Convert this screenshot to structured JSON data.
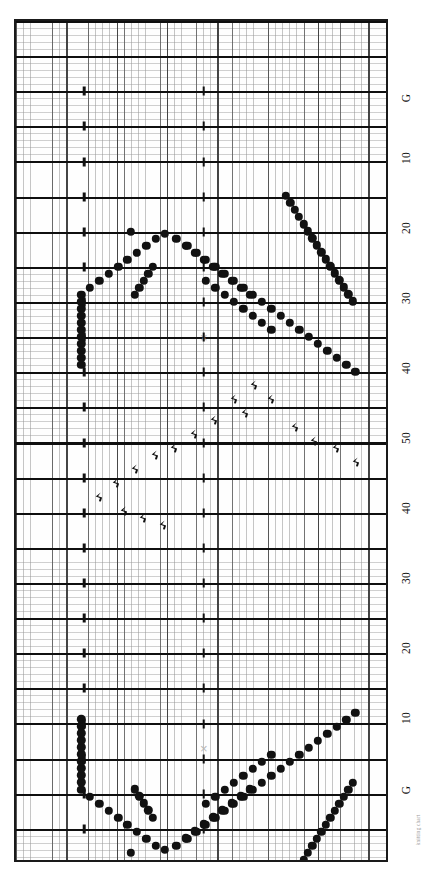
{
  "chart_data": {
    "type": "table",
    "orientation": "rotated-90",
    "grid": {
      "columns": 52,
      "rows": 120,
      "fine_grid": true,
      "bold_every_rows": 5,
      "bold_every_cols": 7,
      "cell_width_px": 7.192,
      "cell_height_px": 7.025
    },
    "legend": {
      "dot": "yarn-over / purl dot",
      "cross": "no-stitch",
      "tick": "decrease"
    },
    "row_labels": [
      "G",
      "10",
      "20",
      "30",
      "40",
      "50",
      "40",
      "30",
      "20",
      "10",
      "G"
    ],
    "row_label_positions_px": [
      98,
      158,
      228,
      298,
      368,
      438,
      508,
      578,
      648,
      718,
      790
    ],
    "footnote": "knitting chart",
    "colors": {
      "symbol": "#111111",
      "cross": "#b8b8b8",
      "grid_fine": "#969696",
      "grid_bold": "#0f0f0f",
      "border": "#1a1a1a",
      "background": "#fefefe"
    },
    "dots": [
      [
        36.0,
        194.0
      ],
      [
        37.0,
        201.5
      ],
      [
        38.0,
        208.5
      ],
      [
        39.0,
        215.5
      ],
      [
        40.0,
        222.5
      ],
      [
        41.0,
        229.5
      ],
      [
        42.0,
        236.5
      ],
      [
        43.0,
        243.5
      ],
      [
        44.0,
        250.5
      ],
      [
        45.0,
        257.5
      ],
      [
        46.0,
        264.5
      ],
      [
        47.0,
        271.5
      ],
      [
        48.0,
        278.5
      ],
      [
        49.0,
        285.5
      ],
      [
        50.0,
        292.5
      ],
      [
        17.0,
        229.5
      ],
      [
        18.0,
        236.5
      ],
      [
        19.0,
        243.5
      ],
      [
        20.0,
        250.5
      ],
      [
        21.0,
        257.5
      ],
      [
        16.0,
        236.5
      ],
      [
        15.0,
        243.5
      ],
      [
        14.0,
        250.5
      ],
      [
        13.0,
        257.5
      ],
      [
        12.0,
        264.5
      ],
      [
        11.0,
        271.5
      ],
      [
        10.0,
        278.5
      ],
      [
        9.0,
        285.5
      ],
      [
        9.0,
        292.5
      ],
      [
        9.0,
        299.5
      ],
      [
        9.0,
        306.5
      ],
      [
        9.0,
        313.5
      ],
      [
        9.0,
        320.5
      ],
      [
        9.0,
        327.5
      ],
      [
        9.0,
        334.5
      ],
      [
        9.0,
        341.5
      ],
      [
        9.0,
        348.5
      ],
      [
        9.0,
        355.5
      ],
      [
        9.0,
        362.5
      ],
      [
        9.0,
        369.5
      ],
      [
        22.0,
        264.5
      ],
      [
        23.0,
        271.5
      ],
      [
        24.0,
        278.5
      ],
      [
        25.0,
        285.5
      ],
      [
        26.0,
        292.5
      ],
      [
        27.0,
        299.5
      ],
      [
        28.0,
        306.5
      ],
      [
        29.0,
        313.5
      ],
      [
        31.0,
        264.5
      ],
      [
        32.0,
        271.5
      ],
      [
        33.0,
        278.5
      ],
      [
        34.0,
        285.5
      ],
      [
        35.0,
        292.5
      ],
      [
        36.0,
        299.5
      ],
      [
        37.0,
        306.5
      ],
      [
        38.0,
        313.5
      ],
      [
        39.0,
        320.5
      ],
      [
        40.0,
        327.5
      ]
    ]
  },
  "page": {
    "background": "#ffffff"
  }
}
